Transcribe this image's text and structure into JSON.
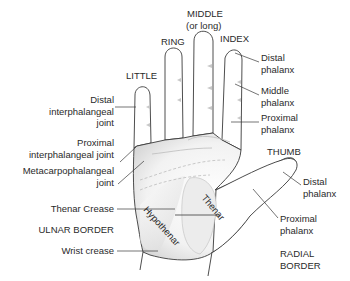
{
  "diagram": {
    "fingers": {
      "little": "LITTLE",
      "ring": "RING",
      "middle_line1": "MIDDLE",
      "middle_line2": "(or long)",
      "index": "INDEX",
      "thumb": "THUMB"
    },
    "left_labels": {
      "dip_line1": "Distal",
      "dip_line2": "interphalangeal",
      "dip_line3": "joint",
      "pip_line1": "Proximal",
      "pip_line2": "interphalangeal joint",
      "mcp_line1": "Metacarpophalangeal",
      "mcp_line2": "joint",
      "thenar_crease": "Thenar Crease",
      "ulnar_border": "ULNAR BORDER",
      "wrist_crease": "Wrist crease"
    },
    "right_labels": {
      "index_distal_line1": "Distal",
      "index_distal_line2": "phalanx",
      "index_middle_line1": "Middle",
      "index_middle_line2": "phalanx",
      "index_proximal_line1": "Proximal",
      "index_proximal_line2": "phalanx",
      "thumb_distal_line1": "Distal",
      "thumb_distal_line2": "phalanx",
      "thumb_proximal_line1": "Proximal",
      "thumb_proximal_line2": "phalanx",
      "radial_line1": "RADIAL",
      "radial_line2": "BORDER"
    },
    "regions": {
      "hypothenar": "Hypothenar",
      "thenar": "Thenar"
    },
    "colors": {
      "outline": "#3a3a3a",
      "shading": "#d9d9d9",
      "text": "#2a2a2a",
      "background": "#ffffff"
    }
  }
}
